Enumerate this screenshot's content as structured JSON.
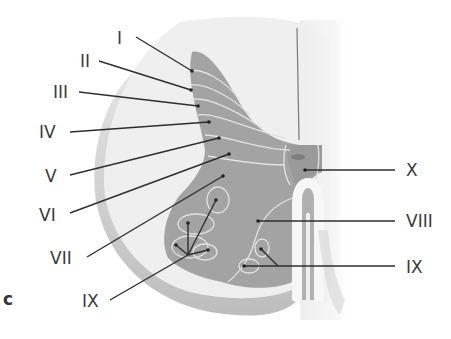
{
  "figure": {
    "panel_label": "c",
    "colors": {
      "background": "#ffffff",
      "white_matter": "#f0f0f0",
      "white_matter_rim": "#cfcfcf",
      "gray_matter": "#9e9e9e",
      "gray_matter_light": "#b4b4b4",
      "lamina_boundary": "#e2e2e2",
      "leader_line": "#2e2e2e",
      "label_text": "#3a3a3a"
    }
  },
  "labels": {
    "left": [
      {
        "id": "I",
        "text": "I"
      },
      {
        "id": "II",
        "text": "II"
      },
      {
        "id": "III",
        "text": "III"
      },
      {
        "id": "IV",
        "text": "IV"
      },
      {
        "id": "V",
        "text": "V"
      },
      {
        "id": "VI",
        "text": "VI"
      },
      {
        "id": "VII",
        "text": "VII"
      },
      {
        "id": "IX_left",
        "text": "IX"
      }
    ],
    "right": [
      {
        "id": "X",
        "text": "X"
      },
      {
        "id": "VIII",
        "text": "VIII"
      },
      {
        "id": "IX_right",
        "text": "IX"
      }
    ]
  }
}
